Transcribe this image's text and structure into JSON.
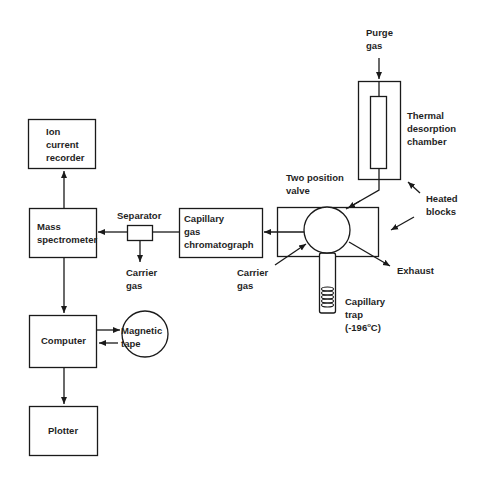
{
  "diagram": {
    "type": "flow-diagram",
    "title": "",
    "nodes": {
      "ion_recorder": {
        "lines": [
          "Ion",
          "current",
          "recorder"
        ]
      },
      "mass_spec": {
        "lines": [
          "Mass",
          "spectrometer"
        ]
      },
      "separator": {
        "label": "Separator"
      },
      "carrier_gas_sep": {
        "lines": [
          "Carrier",
          "gas"
        ]
      },
      "capillary_gc": {
        "lines": [
          "Capillary",
          "gas",
          "chromatograph"
        ]
      },
      "two_position_valve": {
        "lines": [
          "Two position",
          "valve"
        ]
      },
      "carrier_gas_valve": {
        "lines": [
          "Carrier",
          "gas"
        ]
      },
      "exhaust": {
        "label": "Exhaust"
      },
      "capillary_trap": {
        "lines": [
          "Capillary",
          "trap"
        ],
        "temp_prefix": "(-196",
        "temp_sup": "o",
        "temp_suffix": "C)"
      },
      "purge_gas": {
        "lines": [
          "Purge",
          "gas"
        ]
      },
      "thermal_chamber": {
        "lines": [
          "Thermal",
          "desorption",
          "chamber"
        ]
      },
      "heated_blocks": {
        "lines": [
          "Heated",
          "blocks"
        ]
      },
      "computer": {
        "label": "Computer"
      },
      "magnetic_tape": {
        "lines": [
          "Magnetic",
          "tape"
        ]
      },
      "plotter": {
        "label": "Plotter"
      }
    },
    "edges": [
      {
        "from": "Purge gas",
        "to": "Thermal desorption chamber"
      },
      {
        "from": "Thermal desorption chamber",
        "to": "Two position valve"
      },
      {
        "from": "Carrier gas",
        "to": "Two position valve"
      },
      {
        "from": "Two position valve",
        "to": "Exhaust"
      },
      {
        "from": "Two position valve",
        "to": "Capillary gas chromatograph"
      },
      {
        "from": "Capillary gas chromatograph",
        "to": "Separator"
      },
      {
        "from": "Separator",
        "to": "Mass spectrometer"
      },
      {
        "from": "Separator",
        "to": "Carrier gas"
      },
      {
        "from": "Mass spectrometer",
        "to": "Ion current recorder"
      },
      {
        "from": "Mass spectrometer",
        "to": "Computer"
      },
      {
        "from": "Computer",
        "to": "Magnetic tape"
      },
      {
        "from": "Magnetic tape",
        "to": "Computer"
      },
      {
        "from": "Computer",
        "to": "Plotter"
      }
    ],
    "colors": {
      "line": "#1a1a1a",
      "background": "#ffffff"
    }
  }
}
